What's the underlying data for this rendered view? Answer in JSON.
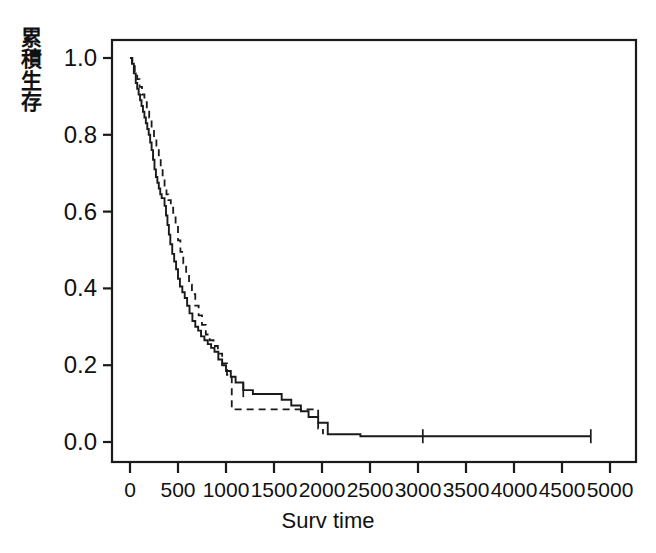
{
  "chart_data": {
    "type": "line",
    "title": "",
    "subtitle": "",
    "xlabel": "Surv time",
    "ylabel": "累積生存",
    "ylabel_chars": [
      "累",
      "積",
      "生",
      "存"
    ],
    "xlim": [
      0,
      5000
    ],
    "ylim": [
      0.0,
      1.0
    ],
    "xticks": [
      0,
      500,
      1000,
      1500,
      2000,
      2500,
      3000,
      3500,
      4000,
      4500,
      5000
    ],
    "xticklabels": [
      "0",
      "500",
      "1000",
      "1500",
      "2000",
      "2500",
      "3000",
      "3500",
      "4000",
      "4500",
      "5000"
    ],
    "yticks": [
      0.0,
      0.2,
      0.4,
      0.6,
      0.8,
      1.0
    ],
    "yticklabels": [
      "0.0",
      "0.2",
      "0.4",
      "0.6",
      "0.8",
      "1.0"
    ],
    "grid": false,
    "legend": "none",
    "frame": "box",
    "line_color": "#1a1a1a",
    "axis_color": "#1a1a1a",
    "background": "#ffffff",
    "series": [
      {
        "name": "solid-curve",
        "style": "solid",
        "color": "#1a1a1a",
        "x": [
          0,
          20,
          40,
          60,
          75,
          90,
          105,
          120,
          135,
          150,
          165,
          180,
          195,
          210,
          225,
          240,
          255,
          270,
          285,
          300,
          315,
          330,
          345,
          360,
          375,
          390,
          405,
          420,
          440,
          460,
          480,
          500,
          520,
          545,
          570,
          595,
          620,
          650,
          680,
          710,
          740,
          775,
          810,
          845,
          880,
          920,
          960,
          1000,
          1050,
          1100,
          1180,
          1280,
          1380,
          1480,
          1580,
          1680,
          1780,
          1860,
          1960,
          2060,
          2400,
          3050,
          4000,
          4800
        ],
        "y": [
          1.0,
          0.985,
          0.96,
          0.935,
          0.92,
          0.905,
          0.89,
          0.875,
          0.86,
          0.845,
          0.83,
          0.815,
          0.8,
          0.78,
          0.76,
          0.735,
          0.71,
          0.69,
          0.675,
          0.66,
          0.645,
          0.635,
          0.635,
          0.615,
          0.59,
          0.565,
          0.54,
          0.515,
          0.49,
          0.47,
          0.45,
          0.425,
          0.405,
          0.39,
          0.375,
          0.355,
          0.335,
          0.315,
          0.3,
          0.29,
          0.275,
          0.265,
          0.255,
          0.245,
          0.235,
          0.215,
          0.2,
          0.185,
          0.17,
          0.155,
          0.135,
          0.125,
          0.125,
          0.125,
          0.11,
          0.095,
          0.08,
          0.065,
          0.05,
          0.02,
          0.015,
          0.015,
          0.015,
          0.015
        ],
        "censor_marks": [
          {
            "x": 1180,
            "y": 0.135
          },
          {
            "x": 3050,
            "y": 0.015
          },
          {
            "x": 4800,
            "y": 0.015
          }
        ]
      },
      {
        "name": "dashed-curve",
        "style": "dashed",
        "color": "#1a1a1a",
        "x": [
          0,
          25,
          50,
          75,
          100,
          125,
          150,
          175,
          200,
          225,
          250,
          275,
          300,
          320,
          340,
          360,
          380,
          400,
          425,
          450,
          475,
          500,
          525,
          555,
          585,
          615,
          645,
          680,
          715,
          750,
          790,
          830,
          870,
          915,
          960,
          1010,
          1060,
          1160,
          1300,
          1450,
          1600,
          1760,
          1900,
          1960,
          2010
        ],
        "y": [
          1.0,
          0.985,
          0.965,
          0.945,
          0.925,
          0.905,
          0.885,
          0.865,
          0.845,
          0.815,
          0.79,
          0.765,
          0.74,
          0.715,
          0.69,
          0.665,
          0.645,
          0.63,
          0.61,
          0.585,
          0.56,
          0.525,
          0.495,
          0.465,
          0.435,
          0.41,
          0.385,
          0.355,
          0.33,
          0.305,
          0.28,
          0.265,
          0.25,
          0.23,
          0.205,
          0.175,
          0.085,
          0.085,
          0.085,
          0.085,
          0.085,
          0.085,
          0.085,
          0.035,
          0.02
        ],
        "censor_marks": []
      }
    ]
  }
}
